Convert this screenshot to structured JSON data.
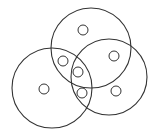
{
  "diagram": {
    "type": "venn",
    "stroke_color": "#333333",
    "background": "#ffffff",
    "sets": [
      {
        "name": "top",
        "cx": 91,
        "cy": 48,
        "r": 40
      },
      {
        "name": "left",
        "cx": 52,
        "cy": 88,
        "r": 40
      },
      {
        "name": "right",
        "cx": 109,
        "cy": 77,
        "r": 38
      }
    ],
    "markers": [
      {
        "region": "top-only",
        "cx": 83,
        "cy": 30,
        "r": 5
      },
      {
        "region": "right-only",
        "cx": 114,
        "cy": 56,
        "r": 5
      },
      {
        "region": "top-left",
        "cx": 63,
        "cy": 61,
        "r": 5
      },
      {
        "region": "all-three",
        "cx": 78,
        "cy": 72,
        "r": 5
      },
      {
        "region": "left-only",
        "cx": 44,
        "cy": 89,
        "r": 5
      },
      {
        "region": "left-right",
        "cx": 82,
        "cy": 93,
        "r": 5
      },
      {
        "region": "right-bottom",
        "cx": 116,
        "cy": 91,
        "r": 5
      }
    ]
  }
}
